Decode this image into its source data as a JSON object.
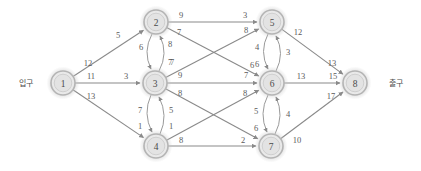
{
  "diagram": {
    "type": "network-flow-graph",
    "entrance_label": "입구",
    "exit_label": "출구",
    "nodes": [
      {
        "id": "1",
        "label": "1",
        "x": 63,
        "y": 83
      },
      {
        "id": "2",
        "label": "2",
        "x": 156,
        "y": 22
      },
      {
        "id": "3",
        "label": "3",
        "x": 155,
        "y": 83
      },
      {
        "id": "4",
        "label": "4",
        "x": 156,
        "y": 146
      },
      {
        "id": "5",
        "label": "5",
        "x": 272,
        "y": 22
      },
      {
        "id": "6",
        "label": "6",
        "x": 272,
        "y": 83
      },
      {
        "id": "7",
        "label": "7",
        "x": 271,
        "y": 146
      },
      {
        "id": "8",
        "label": "8",
        "x": 355,
        "y": 83
      }
    ],
    "straight_edges": [
      {
        "from": "1",
        "to": "2",
        "labels": [
          {
            "text": "12",
            "x": 88,
            "y": 63
          },
          {
            "text": "5",
            "x": 118,
            "y": 35
          }
        ]
      },
      {
        "from": "1",
        "to": "3",
        "labels": [
          {
            "text": "11",
            "x": 91,
            "y": 76
          },
          {
            "text": "3",
            "x": 126,
            "y": 76
          }
        ]
      },
      {
        "from": "1",
        "to": "4",
        "labels": [
          {
            "text": "13",
            "x": 91,
            "y": 96
          }
        ]
      },
      {
        "from": "2",
        "to": "5",
        "labels": [
          {
            "text": "9",
            "x": 181,
            "y": 15
          },
          {
            "text": "3",
            "x": 245,
            "y": 15
          }
        ]
      },
      {
        "from": "2",
        "to": "6",
        "labels": [
          {
            "text": "7",
            "x": 179,
            "y": 32
          },
          {
            "text": "6",
            "x": 252,
            "y": 65
          }
        ]
      },
      {
        "from": "3",
        "to": "5",
        "labels": [
          {
            "text": "7",
            "x": 172,
            "y": 62
          },
          {
            "text": "8",
            "x": 246,
            "y": 30
          }
        ]
      },
      {
        "from": "3",
        "to": "6",
        "labels": [
          {
            "text": "9",
            "x": 180,
            "y": 75
          },
          {
            "text": "7",
            "x": 246,
            "y": 75
          }
        ]
      },
      {
        "from": "3",
        "to": "7",
        "labels": [
          {
            "text": "8",
            "x": 180,
            "y": 93
          },
          {
            "text": "2",
            "x": 243,
            "y": 140
          }
        ]
      },
      {
        "from": "4",
        "to": "6",
        "labels": [
          {
            "text": "8",
            "x": 245,
            "y": 93
          }
        ]
      },
      {
        "from": "4",
        "to": "7",
        "labels": [
          {
            "text": "8",
            "x": 181,
            "y": 140
          }
        ]
      },
      {
        "from": "5",
        "to": "8",
        "labels": [
          {
            "text": "12",
            "x": 298,
            "y": 32
          },
          {
            "text": "13",
            "x": 332,
            "y": 63
          }
        ]
      },
      {
        "from": "6",
        "to": "8",
        "labels": [
          {
            "text": "13",
            "x": 301,
            "y": 76
          },
          {
            "text": "15",
            "x": 333,
            "y": 76
          }
        ]
      },
      {
        "from": "7",
        "to": "8",
        "labels": [
          {
            "text": "10",
            "x": 297,
            "y": 140
          },
          {
            "text": "17",
            "x": 331,
            "y": 96
          }
        ]
      }
    ],
    "curved_edges": [
      {
        "from": "2",
        "to": "3",
        "direction": "down",
        "side": "left",
        "labels": [
          {
            "text": "6",
            "x": 141,
            "y": 47
          }
        ]
      },
      {
        "from": "3",
        "to": "2",
        "direction": "up",
        "side": "right",
        "labels": [
          {
            "text": "8",
            "x": 170,
            "y": 44
          },
          {
            "text": "7",
            "x": 170,
            "y": 62
          }
        ]
      },
      {
        "from": "3",
        "to": "4",
        "direction": "down",
        "side": "left",
        "labels": [
          {
            "text": "7",
            "x": 140,
            "y": 110
          },
          {
            "text": "1",
            "x": 140,
            "y": 126
          }
        ]
      },
      {
        "from": "4",
        "to": "3",
        "direction": "up",
        "side": "right",
        "labels": [
          {
            "text": "5",
            "x": 171,
            "y": 110
          },
          {
            "text": "1",
            "x": 171,
            "y": 126
          }
        ]
      },
      {
        "from": "5",
        "to": "6",
        "direction": "down",
        "side": "left",
        "labels": [
          {
            "text": "4",
            "x": 257,
            "y": 47
          },
          {
            "text": "6",
            "x": 257,
            "y": 64
          }
        ]
      },
      {
        "from": "6",
        "to": "5",
        "direction": "up",
        "side": "right",
        "labels": [
          {
            "text": "3",
            "x": 288,
            "y": 52
          }
        ]
      },
      {
        "from": "6",
        "to": "7",
        "direction": "down",
        "side": "left",
        "labels": [
          {
            "text": "5",
            "x": 256,
            "y": 111
          },
          {
            "text": "6",
            "x": 256,
            "y": 128
          }
        ]
      },
      {
        "from": "7",
        "to": "6",
        "direction": "up",
        "side": "right",
        "labels": [
          {
            "text": "4",
            "x": 288,
            "y": 114
          }
        ]
      }
    ],
    "terminals": [
      {
        "name": "entrance",
        "text": "입구",
        "x": 26,
        "y": 83
      },
      {
        "name": "exit",
        "text": "출구",
        "x": 396,
        "y": 83
      }
    ]
  }
}
